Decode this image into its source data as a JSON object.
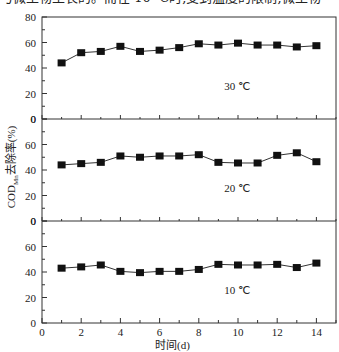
{
  "caption_fragment": "与微生物生长的。而在 10 ℃时,受到温度的限制,微生物",
  "chart_data": {
    "type": "line",
    "layout": "three vertically stacked panels sharing x-axis",
    "xlabel": "时间(d)",
    "ylabel": "COD_Mn去除率(%)",
    "ylabel_main": "COD",
    "ylabel_sub": "Mn",
    "ylabel_rest": "去除率(%)",
    "xlim": [
      0,
      15
    ],
    "x_ticks": [
      0,
      2,
      4,
      6,
      8,
      10,
      12,
      14
    ],
    "ylim": [
      0,
      80
    ],
    "y_ticks_top_panel": [
      0,
      20,
      40,
      60,
      80
    ],
    "y_ticks_other_panels": [
      0,
      20,
      40,
      60
    ],
    "grid": false,
    "marker": "filled-square",
    "line_color": "#333333",
    "marker_color": "#111111",
    "x": [
      1,
      2,
      3,
      4,
      5,
      6,
      7,
      8,
      9,
      10,
      11,
      12,
      13,
      14
    ],
    "series": [
      {
        "name": "30 ℃",
        "label": "30 ℃",
        "panel": 0,
        "values": [
          44,
          52,
          53,
          57,
          53,
          54,
          56,
          59,
          58,
          59.5,
          58,
          58,
          56.5,
          57.5
        ]
      },
      {
        "name": "20 ℃",
        "label": "20 ℃",
        "panel": 1,
        "values": [
          44,
          45,
          46,
          51,
          50,
          51,
          51,
          52,
          46,
          45.5,
          45.5,
          51.5,
          53.5,
          46.5
        ]
      },
      {
        "name": "10 ℃",
        "label": "10 ℃",
        "panel": 2,
        "values": [
          43,
          44,
          45.5,
          40.5,
          39.5,
          40.5,
          40.5,
          42,
          46,
          45.5,
          45.5,
          46,
          43.5,
          47
        ]
      }
    ]
  }
}
